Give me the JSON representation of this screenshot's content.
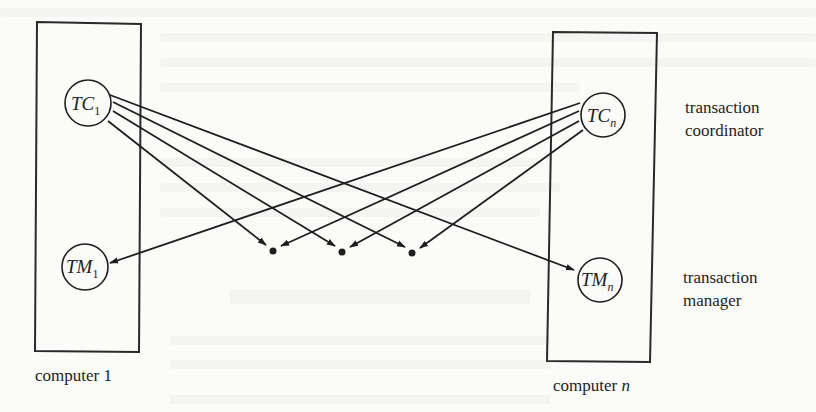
{
  "figure": {
    "computers": [
      {
        "id": "computer-1",
        "label": "computer",
        "label_suffix": "1",
        "coordinator": {
          "name": "TC",
          "subscript": "1"
        },
        "manager": {
          "name": "TM",
          "subscript": "1"
        }
      },
      {
        "id": "computer-n",
        "label": "computer",
        "label_suffix": "n",
        "coordinator": {
          "name": "TC",
          "subscript": "n"
        },
        "manager": {
          "name": "TM",
          "subscript": "n"
        }
      }
    ],
    "side_labels": {
      "coordinator": [
        "transaction",
        "coordinator"
      ],
      "manager": [
        "transaction",
        "manager"
      ]
    },
    "ellipsis_dots_count": 3,
    "colors": {
      "ink": "#1e1e1e",
      "paper": "#fbfbfa"
    }
  }
}
